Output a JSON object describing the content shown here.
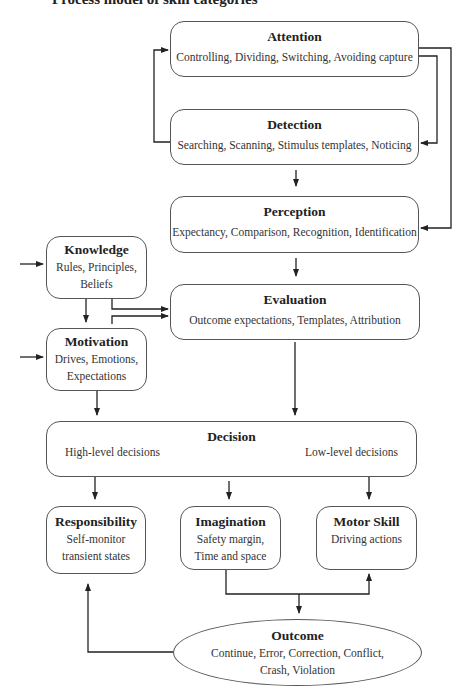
{
  "title": "Process model of skill categories",
  "nodes": {
    "attention": {
      "label": "Attention",
      "text": "Controlling, Dividing, Switching, Avoiding capture"
    },
    "detection": {
      "label": "Detection",
      "text": "Searching, Scanning, Stimulus templates, Noticing"
    },
    "perception": {
      "label": "Perception",
      "text": "Expectancy, Comparison, Recognition, Identification"
    },
    "knowledge": {
      "label": "Knowledge",
      "line1": "Rules, Principles,",
      "line2": "Beliefs"
    },
    "evaluation": {
      "label": "Evaluation",
      "text": "Outcome expectations, Templates, Attribution"
    },
    "motivation": {
      "label": "Motivation",
      "line1": "Drives, Emotions,",
      "line2": "Expectations"
    },
    "decision": {
      "label": "Decision",
      "left": "High-level decisions",
      "right": "Low-level decisions"
    },
    "responsibility": {
      "label": "Responsibility",
      "line1": "Self-monitor",
      "line2": "transient states"
    },
    "imagination": {
      "label": "Imagination",
      "line1": "Safety margin,",
      "line2": "Time and space"
    },
    "motor_skill": {
      "label": "Motor Skill",
      "line1": "Driving actions"
    },
    "outcome": {
      "label": "Outcome",
      "line1": "Continue, Error, Correction, Conflict,",
      "line2": "Crash, Violation"
    }
  },
  "colors": {
    "line": "#222222",
    "border": "#555555"
  }
}
